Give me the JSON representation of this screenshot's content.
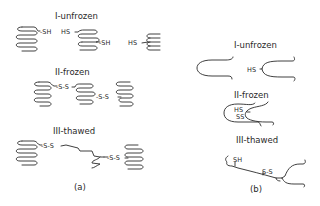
{
  "panel_a": {
    "caption": "(a)",
    "states": [
      {
        "label": "I-unfrozen",
        "groups": [
          "-SH",
          "HS",
          "-SH",
          "HS"
        ]
      },
      {
        "label": "II-frozen",
        "groups": [
          "-S-S",
          "-S-S"
        ]
      },
      {
        "label": "III-thawed",
        "groups": [
          "-S-S",
          "-S-S"
        ]
      }
    ]
  },
  "panel_b": {
    "caption": "(b)",
    "states": [
      {
        "label": "I-unfrozen",
        "groups": [
          "HS"
        ]
      },
      {
        "label": "II-frozen",
        "groups": [
          "HS",
          "SS"
        ]
      },
      {
        "label": "III-thawed",
        "groups": [
          "SH",
          "S-S"
        ]
      }
    ]
  }
}
